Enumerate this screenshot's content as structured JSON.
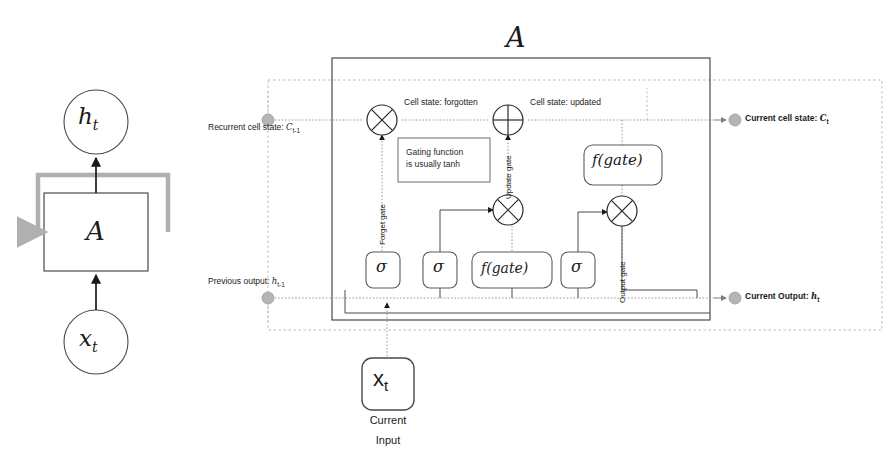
{
  "figure": {
    "title_left": "Simple RNN cell unrolled view",
    "title_right": "LSTM cell internals"
  },
  "left_diagram": {
    "output_node": "h_t",
    "cell_label": "A",
    "input_node": "x_t",
    "loop_name": "recurrent-loop-arrow"
  },
  "right_diagram": {
    "cell_label": "A",
    "inputs": [
      {
        "id": "recurrent-cell-state",
        "label": "Recurrent cell state: ",
        "symbol": "C",
        "sub": "t-1"
      },
      {
        "id": "previous-output",
        "label": "Previous output: ",
        "symbol": "h",
        "sub": "t-1"
      }
    ],
    "outputs": [
      {
        "id": "current-cell-state",
        "label": "Current cell state: ",
        "symbol": "C",
        "sub": "t"
      },
      {
        "id": "current-output",
        "label": "Current Output: ",
        "symbol": "h",
        "sub": "t"
      }
    ],
    "stream_labels": [
      {
        "id": "cell-state-forgotten",
        "text": "Cell state: forgotten"
      },
      {
        "id": "cell-state-updated",
        "text": "Cell state: updated"
      }
    ],
    "gate_labels": [
      {
        "id": "forget-gate",
        "text": "Forget gate"
      },
      {
        "id": "update-gate",
        "text": "Update gate"
      },
      {
        "id": "output-gate",
        "text": "Output gate"
      }
    ],
    "note": {
      "line1": "Gating function",
      "line2": "is usually tanh"
    },
    "gate_boxes": [
      {
        "id": "forget-sigma",
        "text": "σ"
      },
      {
        "id": "update-sigma",
        "text": "σ"
      },
      {
        "id": "candidate-fgate",
        "text": "f(gate)"
      },
      {
        "id": "output-sigma",
        "text": "σ"
      },
      {
        "id": "cellstate-fgate",
        "text": "f(gate)"
      }
    ],
    "operators": [
      {
        "id": "forget-multiply",
        "glyph": "multiply"
      },
      {
        "id": "cellstate-add",
        "glyph": "add"
      },
      {
        "id": "update-multiply",
        "glyph": "multiply"
      },
      {
        "id": "output-multiply",
        "glyph": "multiply"
      }
    ],
    "input_block": {
      "symbol": "x",
      "sub": "t",
      "caption_line1": "Current",
      "caption_line2": "Input"
    }
  },
  "colors": {
    "ink": "#1a1a1a",
    "solid_line": "#4a4a4a",
    "dotted_line": "#9a9a9a",
    "marker_gray": "#aaaaaa",
    "loop_gray": "#b0b0b0",
    "box_stroke": "#555555"
  }
}
